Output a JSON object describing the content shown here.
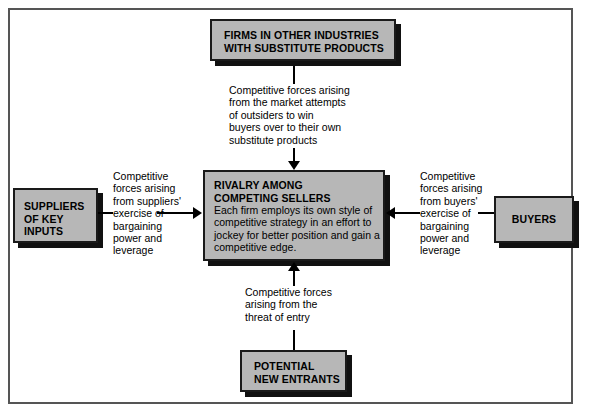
{
  "diagram": {
    "boxes": {
      "substitutes": {
        "title": "FIRMS IN OTHER INDUSTRIES\nWITH SUBSTITUTE PRODUCTS"
      },
      "rivalry": {
        "title": "RIVALRY AMONG\nCOMPETING SELLERS",
        "body": "Each firm employs its own style of\ncompetitive strategy in an effort to\njockey for better position and gain a\ncompetitive edge."
      },
      "suppliers": {
        "title": "SUPPLIERS\nOF KEY\nINPUTS"
      },
      "buyers": {
        "title": "BUYERS"
      },
      "entrants": {
        "title": "POTENTIAL\nNEW ENTRANTS"
      }
    },
    "notes": {
      "substitutes": "Competitive forces arising\nfrom the market attempts\nof outsiders to win\nbuyers over to their own\nsubstitute products",
      "suppliers": "Competitive\nforces arising\nfrom suppliers'\nexercise of\nbargaining\npower and\nleverage",
      "buyers": "Competitive\nforces arising\nfrom buyers'\nexercise of\nbargaining\npower and\nleverage",
      "entrants": "Competitive forces\narising from the\nthreat of entry"
    },
    "colors": {
      "box_fill": "#b7b7b7",
      "box_border": "#1a1a1a",
      "shadow": "#111111",
      "frame": "#555555",
      "text": "#000000"
    }
  }
}
